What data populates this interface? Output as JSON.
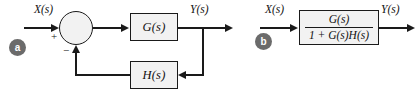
{
  "figure": {
    "background_color": "#ffffff",
    "line_color": "#1a1a1a",
    "block_fill_color": "#f2f2f2",
    "badge_color": "#6b6b6b",
    "badge_text_color": "#ffffff"
  },
  "panels": [
    {
      "badge": "a",
      "caption": "closed-loop feedback diagram",
      "input_label": "X(s)",
      "output_label": "Y(s)",
      "summing_junction": {
        "name": "summing-junction",
        "input_sign": "+",
        "feedback_sign": "−"
      },
      "forward_block": {
        "label": "G(s)"
      },
      "feedback_block": {
        "label": "H(s)"
      }
    },
    {
      "badge": "b",
      "caption": "equivalent single-block diagram",
      "input_label": "X(s)",
      "output_label": "Y(s)",
      "transfer_block": {
        "numerator": "G(s)",
        "denominator": "1 + G(s)H(s)"
      }
    }
  ]
}
